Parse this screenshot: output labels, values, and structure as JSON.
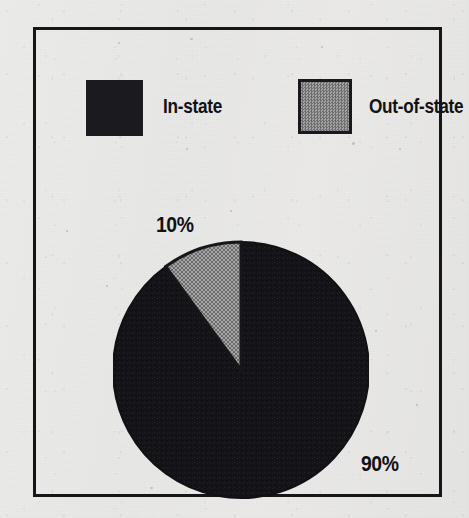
{
  "figure": {
    "frame_color": "#15151a",
    "background_color": "#e9e9e7"
  },
  "legend": {
    "items": [
      {
        "label": "In-state",
        "color": "#1b1b1f",
        "swatch": "filled-black-square"
      },
      {
        "label": "Out-of-state",
        "color": "#8a8a8a",
        "swatch": "filled-gray-square-outlined"
      }
    ]
  },
  "labels": {
    "out_of_state_pct": "10%",
    "in_state_pct": "90%"
  },
  "chart_data": {
    "type": "pie",
    "title": "",
    "categories": [
      "In-state",
      "Out-of-state"
    ],
    "values": [
      90,
      10
    ],
    "value_labels": [
      "90%",
      "10%"
    ],
    "units": "percent",
    "colors": [
      "#1b1b1f",
      "#8a8a8a"
    ],
    "legend_position": "top",
    "start_angle_deg": 90,
    "direction": "counterclockwise",
    "grid": false,
    "slices": [
      {
        "name": "In-state",
        "value": 90,
        "label": "90%",
        "color": "#1b1b1f",
        "label_position": "outside-bottom-right"
      },
      {
        "name": "Out-of-state",
        "value": 10,
        "label": "10%",
        "color": "#8a8a8a",
        "label_position": "outside-top-left"
      }
    ]
  }
}
